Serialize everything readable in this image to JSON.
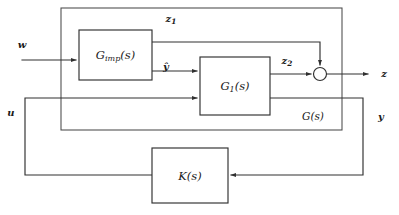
{
  "diagram": {
    "type": "control-block-diagram",
    "background_color": "#ffffff",
    "line_color": "#303030",
    "blocks": [
      {
        "id": "g_imp",
        "label_base": "G",
        "label_subscript": "imp",
        "label_arg": "(s)",
        "label_full": "G_imp(s)",
        "x": 79,
        "y": 30,
        "width": 73,
        "height": 50
      },
      {
        "id": "g1",
        "label_base": "G",
        "label_subscript": "1",
        "label_arg": "(s)",
        "label_full": "G_1(s)",
        "x": 200,
        "y": 57,
        "width": 70,
        "height": 58
      },
      {
        "id": "k",
        "label_base": "K",
        "label_subscript": "",
        "label_arg": "(s)",
        "label_full": "K(s)",
        "x": 152,
        "y": 148,
        "width": 76,
        "height": 55
      }
    ],
    "outer_plant": {
      "id": "g_plant",
      "label": "G(s)",
      "x": 61,
      "y": 8,
      "width": 281,
      "height": 122
    },
    "summing_junction": {
      "id": "sum-z",
      "cx": 320,
      "cy": 74,
      "r": 6.5,
      "inputs": [
        "z_2",
        "z_1"
      ],
      "output": "z"
    },
    "signals": [
      {
        "id": "w",
        "label": "w",
        "x": 22,
        "y": 45,
        "role": "exogenous-input"
      },
      {
        "id": "z1",
        "label": "z",
        "subscript": "1",
        "x": 171,
        "y": 19,
        "role": "performance-output-1"
      },
      {
        "id": "yhat",
        "label": "ŷ",
        "subscript": "",
        "x": 166,
        "y": 67,
        "role": "internal-estimate"
      },
      {
        "id": "z2",
        "label": "z",
        "subscript": "2",
        "x": 287,
        "y": 61,
        "role": "performance-output-2"
      },
      {
        "id": "z",
        "label": "z",
        "x": 384,
        "y": 74,
        "role": "performance-output"
      },
      {
        "id": "u",
        "label": "u",
        "x": 11,
        "y": 113,
        "role": "control-input"
      },
      {
        "id": "y",
        "label": "y",
        "x": 381,
        "y": 117,
        "role": "measured-output"
      },
      {
        "id": "gs",
        "label": "G(s)",
        "x": 313,
        "y": 117,
        "role": "plant-label"
      }
    ]
  }
}
